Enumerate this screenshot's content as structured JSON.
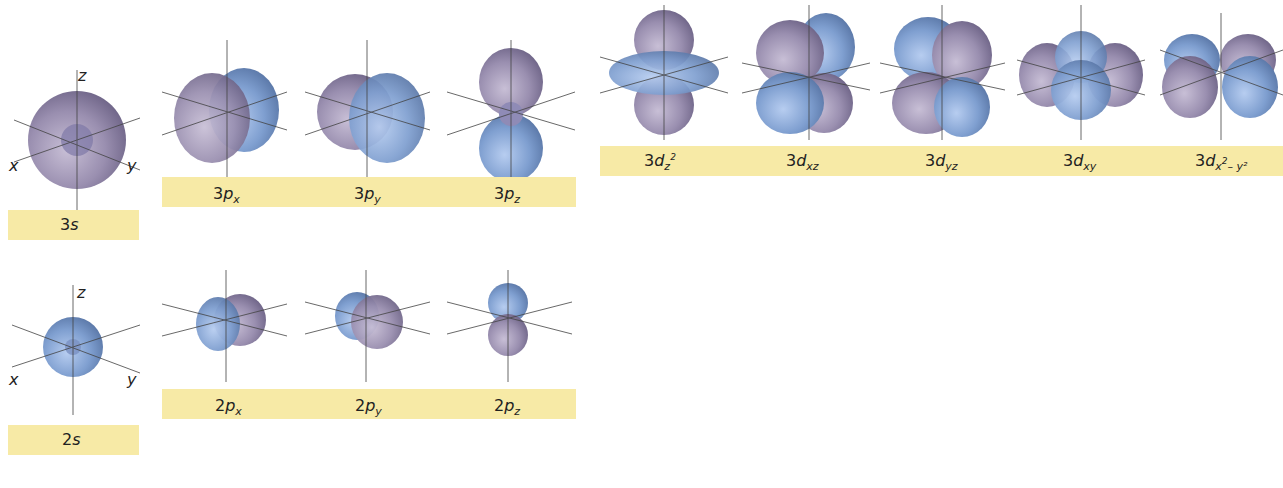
{
  "figure": {
    "colors": {
      "lobe_purple": "#9a8fb0",
      "lobe_blue": "#7f9fd0",
      "label_band": "#f7eaa6",
      "axis_line": "#444444"
    },
    "axis_labels": {
      "x": "x",
      "y": "y",
      "z": "z"
    },
    "rows": [
      {
        "name": "n=3",
        "orbitals": [
          {
            "id": "3s",
            "n": "3",
            "l": "s",
            "sub": "",
            "sup": "",
            "sub2": ""
          },
          {
            "id": "3px",
            "n": "3",
            "l": "p",
            "sub": "x",
            "sup": "",
            "sub2": ""
          },
          {
            "id": "3py",
            "n": "3",
            "l": "p",
            "sub": "y",
            "sup": "",
            "sub2": ""
          },
          {
            "id": "3pz",
            "n": "3",
            "l": "p",
            "sub": "z",
            "sup": "",
            "sub2": ""
          },
          {
            "id": "3dz2",
            "n": "3",
            "l": "d",
            "sub": "z",
            "sup": "2",
            "sub2": ""
          },
          {
            "id": "3dxz",
            "n": "3",
            "l": "d",
            "sub": "xz",
            "sup": "",
            "sub2": ""
          },
          {
            "id": "3dyz",
            "n": "3",
            "l": "d",
            "sub": "yz",
            "sup": "",
            "sub2": ""
          },
          {
            "id": "3dxy",
            "n": "3",
            "l": "d",
            "sub": "xy",
            "sup": "",
            "sub2": ""
          },
          {
            "id": "3dx2y2",
            "n": "3",
            "l": "d",
            "sub": "x",
            "sup": "2",
            "sub2": "– y²"
          }
        ]
      },
      {
        "name": "n=2",
        "orbitals": [
          {
            "id": "2s",
            "n": "2",
            "l": "s",
            "sub": ""
          },
          {
            "id": "2px",
            "n": "2",
            "l": "p",
            "sub": "x"
          },
          {
            "id": "2py",
            "n": "2",
            "l": "p",
            "sub": "y"
          },
          {
            "id": "2pz",
            "n": "2",
            "l": "p",
            "sub": "z"
          }
        ]
      }
    ]
  }
}
